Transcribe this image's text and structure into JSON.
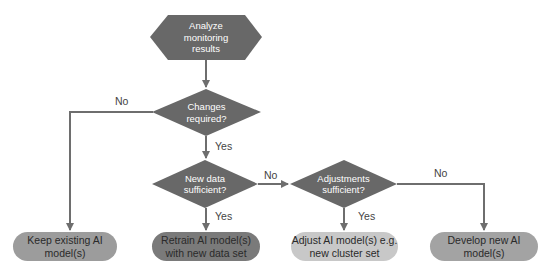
{
  "diagram": {
    "type": "flowchart",
    "colors": {
      "shape_dark": "#686868",
      "line": "#6e6e6e",
      "pill_keep": "#9c9c9c",
      "pill_retrain": "#7a7a7a",
      "pill_adjust": "#c8c8c8",
      "pill_develop": "#a3a3a3"
    },
    "nodes": {
      "start": {
        "shape": "hexagon",
        "lines": [
          "Analyze",
          "monitoring",
          "results"
        ]
      },
      "changes": {
        "shape": "diamond",
        "lines": [
          "Changes",
          "required?"
        ]
      },
      "newdata": {
        "shape": "diamond",
        "lines": [
          "New data",
          "sufficient?"
        ]
      },
      "adjust_q": {
        "shape": "diamond",
        "lines": [
          "Adjustments",
          "sufficient?"
        ]
      },
      "keep": {
        "shape": "pill",
        "lines": [
          "Keep existing AI",
          "model(s)"
        ]
      },
      "retrain": {
        "shape": "pill",
        "lines": [
          "Retrain AI model(s)",
          "with new data set"
        ]
      },
      "adjust": {
        "shape": "pill",
        "lines": [
          "Adjust AI model(s)",
          "e.g. new cluster set"
        ]
      },
      "develop": {
        "shape": "pill",
        "lines": [
          "Develop new AI",
          "model(s)"
        ]
      }
    },
    "edges": [
      {
        "from": "start",
        "to": "changes",
        "label": ""
      },
      {
        "from": "changes",
        "to": "keep",
        "label": "No"
      },
      {
        "from": "changes",
        "to": "newdata",
        "label": "Yes"
      },
      {
        "from": "newdata",
        "to": "retrain",
        "label": "Yes"
      },
      {
        "from": "newdata",
        "to": "adjust_q",
        "label": "No"
      },
      {
        "from": "adjust_q",
        "to": "adjust",
        "label": "Yes"
      },
      {
        "from": "adjust_q",
        "to": "develop",
        "label": "No"
      }
    ],
    "edge_labels": {
      "changes_no": "No",
      "changes_yes": "Yes",
      "newdata_yes": "Yes",
      "newdata_no": "No",
      "adjust_yes": "Yes",
      "adjust_no": "No"
    }
  }
}
